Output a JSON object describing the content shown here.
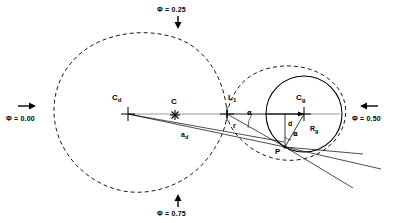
{
  "figure": {
    "background_color": "#ffffff",
    "line_color": "#000000",
    "axis_color": "#808080"
  },
  "phase_labels": [
    {
      "id": "phase-000",
      "text": "Φ = 0.00",
      "arrow": "right",
      "x": 6,
      "y": 118,
      "arrow_x": 22,
      "arrow_y": 106
    },
    {
      "id": "phase-025",
      "text": "Φ = 0.25",
      "arrow": "down",
      "x": 157,
      "y": 10,
      "arrow_x": 178,
      "arrow_y": 20
    },
    {
      "id": "phase-050",
      "text": "Φ = 0.50",
      "arrow": "left",
      "x": 357,
      "y": 118,
      "arrow_x": 368,
      "arrow_y": 106
    },
    {
      "id": "phase-075",
      "text": "Φ = 0.75",
      "arrow": "up",
      "x": 157,
      "y": 209,
      "arrow_x": 178,
      "arrow_y": 196
    }
  ],
  "point_labels": [
    {
      "id": "label-cd",
      "base": "C",
      "sub": "d",
      "x": 113,
      "y": 96
    },
    {
      "id": "label-c",
      "base": "C",
      "sub": "",
      "x": 166,
      "y": 98
    },
    {
      "id": "label-l1",
      "base": "L",
      "sub": "1",
      "x": 229,
      "y": 96
    },
    {
      "id": "label-cg",
      "base": "C",
      "sub": "g",
      "x": 297,
      "y": 96
    },
    {
      "id": "label-p",
      "base": "P",
      "sub": "",
      "x": 277,
      "y": 148
    }
  ],
  "measure_labels": [
    {
      "id": "label-ad",
      "base": "a",
      "sub": "d",
      "x": 183,
      "y": 134
    },
    {
      "id": "label-r",
      "base": "r",
      "sub": "",
      "x": 234,
      "y": 124
    },
    {
      "id": "label-d",
      "base": "d",
      "sub": "",
      "x": 289,
      "y": 122
    },
    {
      "id": "label-rg",
      "base": "R",
      "sub": "g",
      "x": 312,
      "y": 128
    }
  ],
  "angle_labels": [
    {
      "id": "label-alpha-upper",
      "text": "α",
      "x": 248,
      "y": 113
    },
    {
      "id": "label-alpha-lower",
      "text": "α",
      "x": 297,
      "y": 133
    }
  ],
  "geometry": {
    "axis_y": 114,
    "axis_x_start": 128,
    "axis_x_end": 340,
    "donor": {
      "center_x": 133,
      "center_y": 113,
      "radius": 79,
      "label": "donor-roche-lobe"
    },
    "gainer_lobe": {
      "center_x": 299,
      "center_y": 114,
      "radius": 44,
      "label": "gainer-roche-lobe"
    },
    "gainer_star": {
      "center_x": 304,
      "center_y": 114,
      "radius": 38,
      "label": "gainer-star"
    },
    "markers": {
      "cd": {
        "x": 128,
        "y": 114,
        "type": "cross"
      },
      "c": {
        "x": 175,
        "y": 115,
        "type": "asterisk"
      },
      "l1": {
        "x": 227,
        "y": 114,
        "type": "cross"
      },
      "cg": {
        "x": 304,
        "y": 114,
        "type": "cross"
      },
      "p": {
        "x": 285,
        "y": 147,
        "type": "vertex"
      }
    },
    "stream_lines": [
      {
        "from_x": 128,
        "from_y": 114,
        "to_x": 285,
        "to_y": 147
      },
      {
        "from_x": 128,
        "from_y": 114,
        "to_x": 283,
        "to_y": 143
      }
    ],
    "tangent_lines": [
      {
        "from_x": 285,
        "from_y": 147,
        "to_x": 380,
        "to_y": 169
      },
      {
        "from_x": 285,
        "from_y": 147,
        "to_x": 362,
        "to_y": 153
      },
      {
        "from_x": 285,
        "from_y": 147,
        "to_x": 352,
        "to_y": 186
      }
    ]
  }
}
